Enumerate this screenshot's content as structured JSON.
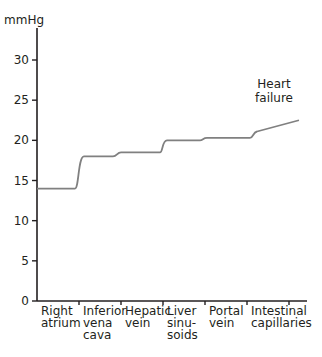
{
  "chart_data": {
    "type": "line",
    "title": "",
    "ylabel": "mmHg",
    "xlabel": "",
    "ylim": [
      0,
      33
    ],
    "yticks": [
      0,
      5,
      10,
      15,
      20,
      25,
      30
    ],
    "grid": false,
    "categories": [
      {
        "lines": [
          "Right",
          "atrium"
        ]
      },
      {
        "lines": [
          "Inferior",
          "vena",
          "cava"
        ]
      },
      {
        "lines": [
          "Hepatic",
          "vein"
        ]
      },
      {
        "lines": [
          "Liver",
          "sinu-",
          "soids"
        ]
      },
      {
        "lines": [
          "Portal",
          "vein"
        ]
      },
      {
        "lines": [
          "Intestinal",
          "capillaries"
        ]
      }
    ],
    "series": [
      {
        "name": "Heart failure",
        "values": [
          14,
          18,
          18.5,
          20,
          20.3,
          22.5
        ],
        "color": "#808080"
      }
    ],
    "annotations": [
      {
        "text": [
          "Heart",
          "failure"
        ],
        "near": "end of line"
      }
    ]
  }
}
